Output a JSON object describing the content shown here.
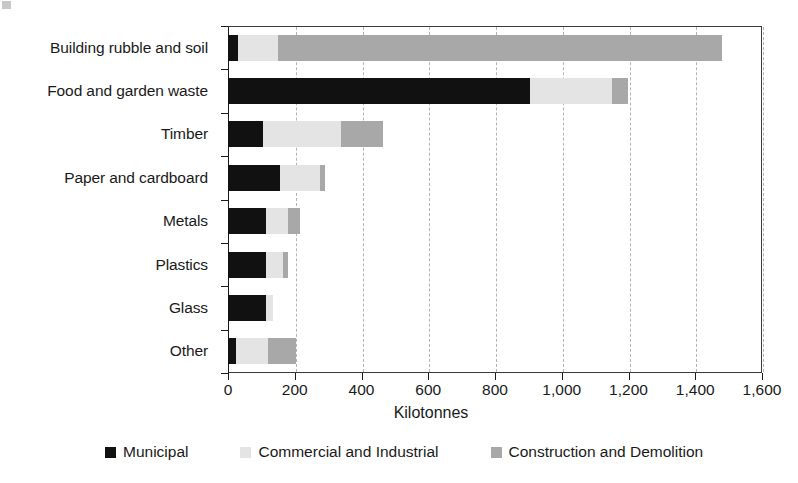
{
  "chart_data": {
    "type": "bar",
    "orientation": "horizontal",
    "stacked": true,
    "title": "",
    "xlabel": "Kilotonnes",
    "ylabel": "",
    "xlim": [
      0,
      1600
    ],
    "xticks": [
      0,
      200,
      400,
      600,
      800,
      1000,
      1200,
      1400,
      1600
    ],
    "xtick_labels": [
      "0",
      "200",
      "400",
      "600",
      "800",
      "1,000",
      "1,200",
      "1,400",
      "1,600"
    ],
    "grid": "vertical-dashed",
    "legend_position": "bottom",
    "categories": [
      "Building rubble and soil",
      "Food and garden waste",
      "Timber",
      "Paper and cardboard",
      "Metals",
      "Plastics",
      "Glass",
      "Other"
    ],
    "series": [
      {
        "name": "Municipal",
        "color": "#111111",
        "values": [
          30,
          905,
          105,
          155,
          115,
          115,
          115,
          25
        ]
      },
      {
        "name": "Commercial and Industrial",
        "color": "#e4e4e4",
        "values": [
          120,
          245,
          235,
          120,
          65,
          50,
          20,
          95
        ]
      },
      {
        "name": "Construction and Demolition",
        "color": "#a8a8a8",
        "values": [
          1330,
          50,
          125,
          15,
          35,
          15,
          0,
          85
        ]
      }
    ],
    "totals": [
      1480,
      1200,
      465,
      290,
      215,
      180,
      135,
      205
    ]
  },
  "legend": {
    "items": [
      {
        "label": "Municipal",
        "color": "#111111"
      },
      {
        "label": "Commercial and Industrial",
        "color": "#e4e4e4"
      },
      {
        "label": "Construction and Demolition",
        "color": "#a8a8a8"
      }
    ]
  }
}
